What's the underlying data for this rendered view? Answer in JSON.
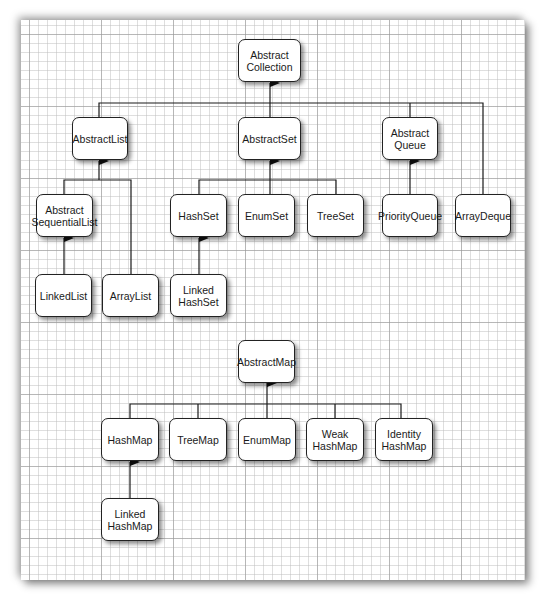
{
  "diagram": {
    "title": "",
    "collections": {
      "abstract_collection": "Abstract\nCollection",
      "abstract_list": "AbstractList",
      "abstract_set": "AbstractSet",
      "abstract_queue": "Abstract\nQueue",
      "abstract_sequential_list": "Abstract\nSequentialList",
      "hash_set": "HashSet",
      "enum_set": "EnumSet",
      "tree_set": "TreeSet",
      "priority_queue": "PriorityQueue",
      "array_deque": "ArrayDeque",
      "linked_list": "LinkedList",
      "array_list": "ArrayList",
      "linked_hash_set": "Linked\nHashSet"
    },
    "maps": {
      "abstract_map": "AbstractMap",
      "hash_map": "HashMap",
      "tree_map": "TreeMap",
      "enum_map": "EnumMap",
      "weak_hash_map": "Weak\nHashMap",
      "identity_hash_map": "Identity\nHashMap",
      "linked_hash_map": "Linked\nHashMap"
    },
    "edges": [
      [
        "AbstractList",
        "AbstractCollection"
      ],
      [
        "AbstractSet",
        "AbstractCollection"
      ],
      [
        "AbstractQueue",
        "AbstractCollection"
      ],
      [
        "ArrayDeque",
        "AbstractCollection"
      ],
      [
        "AbstractSequentialList",
        "AbstractList"
      ],
      [
        "ArrayList",
        "AbstractList"
      ],
      [
        "LinkedList",
        "AbstractSequentialList"
      ],
      [
        "HashSet",
        "AbstractSet"
      ],
      [
        "EnumSet",
        "AbstractSet"
      ],
      [
        "TreeSet",
        "AbstractSet"
      ],
      [
        "LinkedHashSet",
        "HashSet"
      ],
      [
        "PriorityQueue",
        "AbstractQueue"
      ],
      [
        "HashMap",
        "AbstractMap"
      ],
      [
        "TreeMap",
        "AbstractMap"
      ],
      [
        "EnumMap",
        "AbstractMap"
      ],
      [
        "WeakHashMap",
        "AbstractMap"
      ],
      [
        "IdentityHashMap",
        "AbstractMap"
      ],
      [
        "LinkedHashMap",
        "HashMap"
      ]
    ],
    "colors": {
      "line": "#1a1a1a",
      "box_border": "#222222",
      "box_fill": "#ffffff",
      "grid": "#bebebe"
    }
  }
}
